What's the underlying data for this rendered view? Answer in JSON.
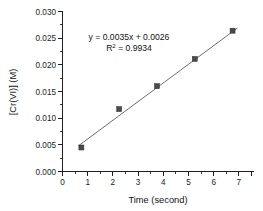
{
  "chart_data": {
    "type": "scatter",
    "title": "",
    "xlabel": "Time (second)",
    "ylabel": "[Cr(VI)] (M)",
    "xlim": [
      0,
      7.6
    ],
    "ylim": [
      0,
      0.03
    ],
    "xticks": [
      "0",
      "1",
      "2",
      "3",
      "4",
      "5",
      "6",
      "7"
    ],
    "xtick_values": [
      0,
      1,
      2,
      3,
      4,
      5,
      6,
      7
    ],
    "xminor_interval": 0.5,
    "yticks": [
      "0.000",
      "0.005",
      "0.010",
      "0.015",
      "0.020",
      "0.025",
      "0.030"
    ],
    "ytick_values": [
      0.0,
      0.005,
      0.01,
      0.015,
      0.02,
      0.025,
      0.03
    ],
    "yminor_interval": 0.0025,
    "grid": false,
    "legend": "none",
    "x": [
      0.75,
      2.25,
      3.75,
      5.25,
      6.75
    ],
    "y": [
      0.0045,
      0.0117,
      0.016,
      0.0211,
      0.0264
    ],
    "series": [
      {
        "name": "[Cr(VI)] vs time",
        "marker": "square",
        "marker_color": "#4a4a4a",
        "x": [
          0.75,
          2.25,
          3.75,
          5.25,
          6.75
        ],
        "values": [
          0.0045,
          0.0117,
          0.016,
          0.0211,
          0.0264
        ]
      }
    ],
    "trendline": {
      "type": "linear",
      "slope": 0.0035,
      "intercept": 0.0026,
      "color": "#6d6d6d",
      "x_start": 0.62,
      "x_end": 6.95
    },
    "annotations": {
      "equation": "y = 0.0035x + 0.0026",
      "r_squared_prefix": "R",
      "r_squared_sup": "2",
      "r_squared_value": " = 0.9934"
    },
    "colors": {
      "axis": "#1f1f1f",
      "marker": "#4a4a4a",
      "line": "#6d6d6d",
      "background": "#ffffff"
    }
  }
}
